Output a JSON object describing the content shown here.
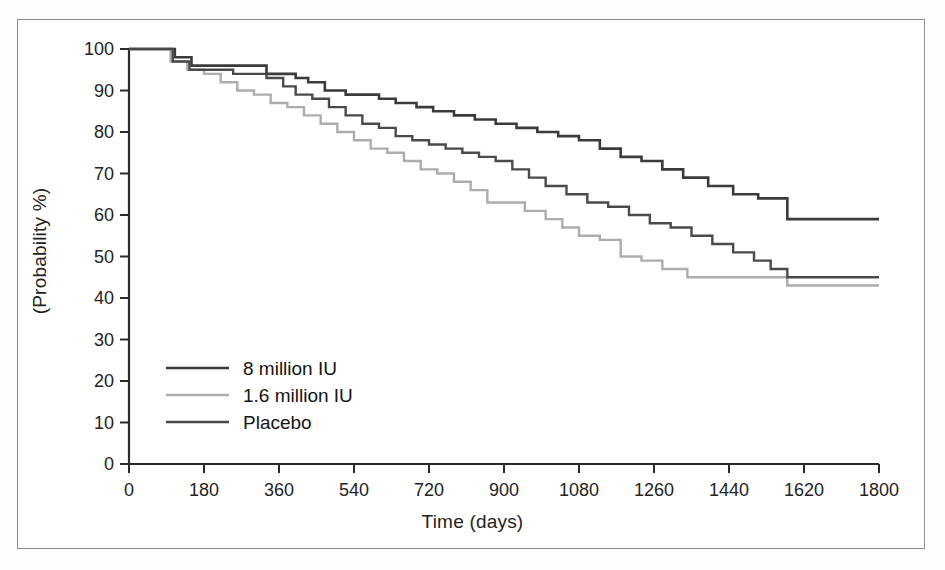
{
  "figure": {
    "background_color": "#ffffff",
    "frame_color": "#8d8d8d"
  },
  "chart_data": {
    "type": "line",
    "title": "",
    "subtitle": "",
    "xlabel": "Time (days)",
    "ylabel": "(Probability %)",
    "xlim": [
      0,
      1800
    ],
    "ylim": [
      0,
      100
    ],
    "xticks": [
      0,
      180,
      360,
      540,
      720,
      900,
      1080,
      1260,
      1440,
      1620,
      1800
    ],
    "yticks": [
      0,
      10,
      20,
      30,
      40,
      50,
      60,
      70,
      80,
      90,
      100
    ],
    "grid": false,
    "legend_position": "lower-left-inside",
    "step_type": "post",
    "annotations": [],
    "series": [
      {
        "name": "8 million IU",
        "color": "#3b3b3b",
        "line_width": 2.6,
        "final_value": 59,
        "x": [
          0,
          70,
          110,
          150,
          300,
          330,
          360,
          400,
          430,
          470,
          520,
          560,
          600,
          640,
          690,
          730,
          780,
          830,
          880,
          930,
          980,
          1030,
          1080,
          1130,
          1180,
          1230,
          1280,
          1330,
          1390,
          1450,
          1510,
          1570,
          1580,
          1800
        ],
        "y": [
          100,
          100,
          98,
          96,
          96,
          94,
          94,
          93,
          92,
          90,
          89,
          89,
          88,
          87,
          86,
          85,
          84,
          83,
          82,
          81,
          80,
          79,
          78,
          76,
          74,
          73,
          71,
          69,
          67,
          65,
          64,
          64,
          59,
          59
        ]
      },
      {
        "name": "1.6 million IU",
        "color": "#adadad",
        "line_width": 2.4,
        "final_value": 43,
        "x": [
          0,
          60,
          100,
          140,
          180,
          220,
          260,
          300,
          340,
          380,
          420,
          460,
          500,
          540,
          580,
          620,
          660,
          700,
          740,
          780,
          820,
          860,
          900,
          950,
          1000,
          1040,
          1080,
          1130,
          1180,
          1230,
          1280,
          1340,
          1400,
          1460,
          1520,
          1570,
          1580,
          1800
        ],
        "y": [
          100,
          100,
          97,
          95,
          94,
          92,
          90,
          89,
          87,
          86,
          84,
          82,
          80,
          78,
          76,
          75,
          73,
          71,
          70,
          68,
          66,
          63,
          63,
          61,
          59,
          57,
          55,
          54,
          50,
          49,
          47,
          45,
          45,
          45,
          45,
          45,
          43,
          43
        ]
      },
      {
        "name": "Placebo",
        "color": "#4a4a4a",
        "line_width": 2.4,
        "final_value": 45,
        "x": [
          0,
          65,
          105,
          145,
          200,
          250,
          300,
          330,
          370,
          400,
          440,
          480,
          520,
          560,
          600,
          640,
          680,
          720,
          760,
          800,
          840,
          880,
          920,
          960,
          1000,
          1050,
          1100,
          1150,
          1200,
          1250,
          1300,
          1350,
          1400,
          1450,
          1500,
          1540,
          1580,
          1800
        ],
        "y": [
          100,
          100,
          97,
          95,
          95,
          94,
          94,
          93,
          91,
          89,
          88,
          86,
          84,
          82,
          81,
          79,
          78,
          77,
          76,
          75,
          74,
          73,
          71,
          69,
          67,
          65,
          63,
          62,
          60,
          58,
          57,
          55,
          53,
          51,
          49,
          47,
          45,
          45
        ]
      }
    ]
  },
  "legend": {
    "entries": [
      {
        "label": "8 million IU",
        "color": "#3b3b3b"
      },
      {
        "label": "1.6 million IU",
        "color": "#adadad"
      },
      {
        "label": "Placebo",
        "color": "#4a4a4a"
      }
    ]
  }
}
